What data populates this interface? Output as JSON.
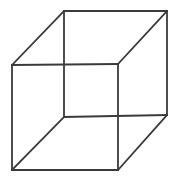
{
  "figure": {
    "kind": "wireframe-cube",
    "background_color": "#ffffff",
    "line_color": "#3a3a3a",
    "line_width": 1.8,
    "canvas": {
      "width": 183,
      "height": 181
    }
  },
  "chart_data": {
    "type": "diagram",
    "projection": "oblique / cabinet parallel projection",
    "vertices": {
      "front_top_left": {
        "x": 12,
        "y": 65,
        "label": "A"
      },
      "front_top_right": {
        "x": 118,
        "y": 64,
        "label": "B"
      },
      "front_bottom_right": {
        "x": 118,
        "y": 170,
        "label": "C"
      },
      "front_bottom_left": {
        "x": 12,
        "y": 170,
        "label": "D"
      },
      "back_top_left": {
        "x": 64,
        "y": 11,
        "label": "E"
      },
      "back_top_right": {
        "x": 167,
        "y": 11,
        "label": "F"
      },
      "back_bottom_right": {
        "x": 167,
        "y": 115,
        "label": "G"
      },
      "back_bottom_left": {
        "x": 64,
        "y": 117,
        "label": "H"
      }
    },
    "edges": [
      {
        "name": "front-top",
        "from": "front_top_left",
        "to": "front_top_right",
        "points": "12,65 118,64"
      },
      {
        "name": "front-right",
        "from": "front_top_right",
        "to": "front_bottom_right",
        "points": "118,64 118,170"
      },
      {
        "name": "front-bottom",
        "from": "front_bottom_right",
        "to": "front_bottom_left",
        "points": "118,170 12,170"
      },
      {
        "name": "front-left",
        "from": "front_bottom_left",
        "to": "front_top_left",
        "points": "12,170 12,65"
      },
      {
        "name": "back-top",
        "from": "back_top_left",
        "to": "back_top_right",
        "points": "64,11 167,11"
      },
      {
        "name": "back-right",
        "from": "back_top_right",
        "to": "back_bottom_right",
        "points": "167,11 167,115"
      },
      {
        "name": "back-bottom",
        "from": "back_bottom_right",
        "to": "back_bottom_left",
        "points": "167,115 64,117"
      },
      {
        "name": "back-left",
        "from": "back_bottom_left",
        "to": "back_top_left",
        "points": "64,117 64,11"
      },
      {
        "name": "connector-top-left",
        "from": "front_top_left",
        "to": "back_top_left",
        "points": "12,65 64,11"
      },
      {
        "name": "connector-top-right",
        "from": "front_top_right",
        "to": "back_top_right",
        "points": "118,64 167,11"
      },
      {
        "name": "connector-bottom-right",
        "from": "front_bottom_right",
        "to": "back_bottom_right",
        "points": "118,170 167,115"
      },
      {
        "name": "connector-bottom-left",
        "from": "front_bottom_left",
        "to": "back_bottom_left",
        "points": "12,170 64,117"
      }
    ],
    "edge_count": 12,
    "vertex_count": 8,
    "face_count": 6,
    "annotations": [],
    "legend": [],
    "xlabel": "",
    "ylabel": ""
  }
}
